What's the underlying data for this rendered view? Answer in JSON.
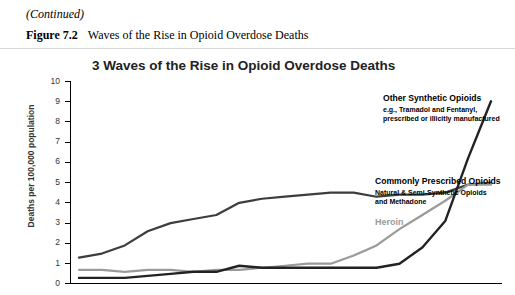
{
  "document": {
    "continued_note": "(Continued)",
    "figure_label": "Figure 7.2",
    "figure_title": "Waves of the Rise in Opioid Overdose Deaths"
  },
  "chart_data": {
    "type": "line",
    "title": "3 Waves of the Rise in Opioid Overdose Deaths",
    "xlabel": "",
    "ylabel": "Deaths per 100,000 population",
    "ylim": [
      0,
      10
    ],
    "yticks": [
      "0",
      "1",
      "2",
      "3",
      "4",
      "5",
      "6",
      "7",
      "8",
      "9",
      "10"
    ],
    "grid": false,
    "legend_position": "inline-annotations",
    "x": [
      1999,
      2000,
      2001,
      2002,
      2003,
      2004,
      2005,
      2006,
      2007,
      2008,
      2009,
      2010,
      2011,
      2012,
      2013,
      2014,
      2015,
      2016,
      2017
    ],
    "series": [
      {
        "name": "Commonly Prescribed Opioids",
        "subtitle": "Natural & Semi-Synthetic Opioids and Methadone",
        "color": "#3d3d3d",
        "values": [
          1.3,
          1.5,
          1.9,
          2.6,
          3.0,
          3.2,
          3.4,
          4.0,
          4.2,
          4.3,
          4.4,
          4.5,
          4.5,
          4.3,
          4.4,
          4.4,
          4.5,
          4.9,
          5.0
        ]
      },
      {
        "name": "Heroin",
        "subtitle": "",
        "color": "#9a9a9a",
        "values": [
          0.7,
          0.7,
          0.6,
          0.7,
          0.7,
          0.6,
          0.7,
          0.7,
          0.8,
          0.9,
          1.0,
          1.0,
          1.4,
          1.9,
          2.7,
          3.4,
          4.1,
          4.9,
          4.9
        ]
      },
      {
        "name": "Other Synthetic Opioids",
        "subtitle": "e.g., Tramadol and Fentanyl, prescribed or illicitly manufactured",
        "color": "#222222",
        "values": [
          0.3,
          0.3,
          0.3,
          0.4,
          0.5,
          0.6,
          0.6,
          0.9,
          0.8,
          0.8,
          0.8,
          0.8,
          0.8,
          0.8,
          1.0,
          1.8,
          3.1,
          6.2,
          9.0
        ]
      }
    ],
    "annotations": [
      {
        "id": "other-synthetic-opioids",
        "title": "Other Synthetic Opioids",
        "subtitle": "e.g., Tramadol and Fentanyl,\nprescribed or illicitly manufactured"
      },
      {
        "id": "commonly-prescribed-opioids",
        "title": "Commonly Prescribed Opioids",
        "subtitle": "Natural & Semi-Synthetic Opioids\nand Methadone"
      },
      {
        "id": "heroin",
        "title": "Heroin",
        "subtitle": ""
      }
    ]
  }
}
